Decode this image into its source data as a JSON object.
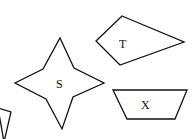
{
  "diagram": {
    "shapes": [
      {
        "id": "partial",
        "label": "",
        "points": "-2,108 11,112 4,142"
      },
      {
        "id": "S",
        "label": "S",
        "kind": "four-pointed star",
        "points": "60,38 74,68 104,83 73,97 62,129 46,99 15,83 43,69",
        "label_pos": [
          58,
          88
        ]
      },
      {
        "id": "T",
        "label": "T",
        "kind": "kite quadrilateral",
        "points": "122,16 184,42 120,65 96,41",
        "label_pos": [
          124,
          48
        ]
      },
      {
        "id": "X",
        "label": "X",
        "kind": "trapezoid",
        "points": "113,90 187,90 175,119 127,119",
        "label_pos": [
          145,
          110
        ]
      }
    ]
  }
}
